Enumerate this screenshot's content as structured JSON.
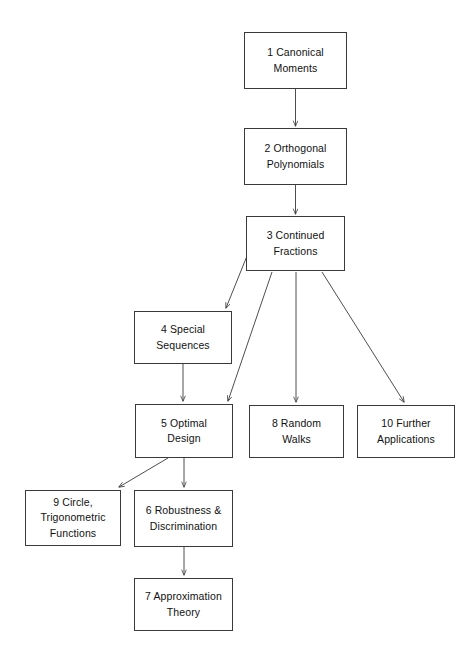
{
  "diagram": {
    "type": "flowchart",
    "title": "",
    "background_color": "#ffffff",
    "box_border_color": "#3a3a3a",
    "edge_color": "#3a3a3a",
    "text_color": "#111111",
    "nodes": [
      {
        "id": "n1",
        "number": "1",
        "label": "1   Canonical\nMoments",
        "x": 244,
        "y": 32,
        "w": 103,
        "h": 57
      },
      {
        "id": "n2",
        "number": "2",
        "label": "2   Orthogonal\nPolynomials",
        "x": 244,
        "y": 128,
        "w": 103,
        "h": 57
      },
      {
        "id": "n3",
        "number": "3",
        "label": "3   Continued\nFractions",
        "x": 246,
        "y": 216,
        "w": 99,
        "h": 55
      },
      {
        "id": "n4",
        "number": "4",
        "label": "4   Special\nSequences",
        "x": 134,
        "y": 311,
        "w": 98,
        "h": 53
      },
      {
        "id": "n5",
        "number": "5",
        "label": "5   Optimal\nDesign",
        "x": 135,
        "y": 404,
        "w": 98,
        "h": 54
      },
      {
        "id": "n8",
        "number": "8",
        "label": "8   Random\nWalks",
        "x": 249,
        "y": 405,
        "w": 95,
        "h": 53
      },
      {
        "id": "n10",
        "number": "10",
        "label": "10   Further\nApplications",
        "x": 357,
        "y": 405,
        "w": 98,
        "h": 53
      },
      {
        "id": "n9",
        "number": "9",
        "label": "9   Circle,\nTrigonometric\nFunctions",
        "x": 25,
        "y": 490,
        "w": 96,
        "h": 56
      },
      {
        "id": "n6",
        "number": "6",
        "label": "6   Robustness &\nDiscrimination",
        "x": 134,
        "y": 490,
        "w": 99,
        "h": 57
      },
      {
        "id": "n7",
        "number": "7",
        "label": "7   Approximation\nTheory",
        "x": 134,
        "y": 578,
        "w": 99,
        "h": 53
      }
    ],
    "edges": [
      {
        "from": "n1",
        "to": "n2",
        "path": "M 295.5 89 L 295.5 126",
        "arrow_at": [
          295.5,
          127
        ]
      },
      {
        "from": "n2",
        "to": "n3",
        "path": "M 295.5 185 L 295.5 214",
        "arrow_at": [
          295.5,
          215
        ]
      },
      {
        "from": "n3",
        "to": "n4",
        "path": "M 249 251 L 226 308",
        "arrow_at": [
          225.5,
          309.5
        ]
      },
      {
        "from": "n3",
        "to": "n5",
        "path": "M 272 272 L 228 401",
        "arrow_at": [
          227.5,
          402.5
        ]
      },
      {
        "from": "n3",
        "to": "n8",
        "path": "M 296 272 L 296 402",
        "arrow_at": [
          296,
          403
        ]
      },
      {
        "from": "n3",
        "to": "n10",
        "path": "M 322 272 L 404 402",
        "arrow_at": [
          404.5,
          403.5
        ]
      },
      {
        "from": "n4",
        "to": "n5",
        "path": "M 183 364 L 183 401",
        "arrow_at": [
          183,
          402
        ]
      },
      {
        "from": "n5",
        "to": "n9",
        "path": "M 168 458 L 119 487",
        "arrow_at": [
          118,
          488
        ]
      },
      {
        "from": "n5",
        "to": "n6",
        "path": "M 184 458 L 184 487",
        "arrow_at": [
          184,
          488
        ]
      },
      {
        "from": "n6",
        "to": "n7",
        "path": "M 184 547 L 184 575",
        "arrow_at": [
          184,
          576
        ]
      }
    ]
  }
}
